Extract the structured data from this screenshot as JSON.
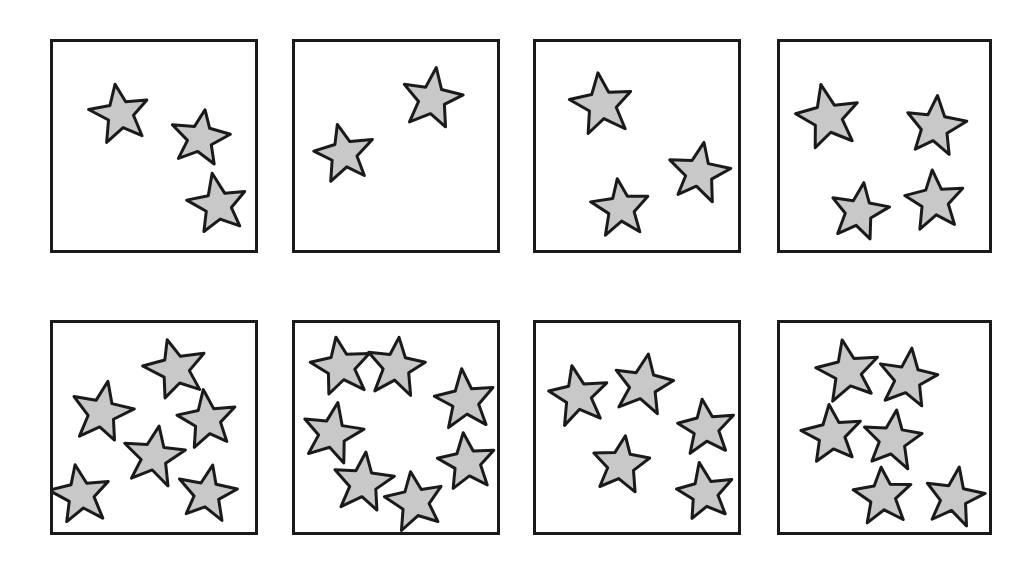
{
  "figure": {
    "background_color": "#ffffff",
    "panel_border_color": "#1a1a1a",
    "panel_border_width_px": 3,
    "star_fill_color": "#c8c8c8",
    "star_outline_color": "#1a1a1a",
    "star_outline_width_px": 3,
    "rows": 2,
    "columns": 4,
    "panel_count": 8,
    "total_star_count": 36
  },
  "panels": [
    {
      "id": "panel-1",
      "index": 1,
      "row": 1,
      "column": 1,
      "label": "Panel 1",
      "star_count": 3,
      "box": {
        "x": 50,
        "y": 39,
        "width": 208,
        "height": 214
      },
      "stars": [
        {
          "cx": 67,
          "cy": 72,
          "r": 31,
          "rotation": -12
        },
        {
          "cx": 147,
          "cy": 96,
          "r": 30,
          "rotation": 10
        },
        {
          "cx": 165,
          "cy": 163,
          "r": 31,
          "rotation": -8
        }
      ]
    },
    {
      "id": "panel-2",
      "index": 2,
      "row": 1,
      "column": 2,
      "label": "Panel 2",
      "star_count": 2,
      "box": {
        "x": 292,
        "y": 39,
        "width": 208,
        "height": 214
      },
      "stars": [
        {
          "cx": 137,
          "cy": 57,
          "r": 32,
          "rotation": 8
        },
        {
          "cx": 49,
          "cy": 112,
          "r": 31,
          "rotation": -10
        }
      ]
    },
    {
      "id": "panel-3",
      "index": 3,
      "row": 1,
      "column": 3,
      "label": "Panel 3",
      "star_count": 3,
      "box": {
        "x": 533,
        "y": 39,
        "width": 208,
        "height": 214
      },
      "stars": [
        {
          "cx": 66,
          "cy": 63,
          "r": 32,
          "rotation": -10
        },
        {
          "cx": 163,
          "cy": 131,
          "r": 31,
          "rotation": 9
        },
        {
          "cx": 85,
          "cy": 166,
          "r": 30,
          "rotation": -5
        }
      ]
    },
    {
      "id": "panel-4",
      "index": 4,
      "row": 1,
      "column": 4,
      "label": "Panel 4",
      "star_count": 4,
      "box": {
        "x": 777,
        "y": 39,
        "width": 215,
        "height": 214
      },
      "stars": [
        {
          "cx": 48,
          "cy": 76,
          "r": 33,
          "rotation": -12
        },
        {
          "cx": 155,
          "cy": 85,
          "r": 31,
          "rotation": 7
        },
        {
          "cx": 155,
          "cy": 159,
          "r": 31,
          "rotation": -6
        },
        {
          "cx": 79,
          "cy": 170,
          "r": 30,
          "rotation": 11
        }
      ]
    },
    {
      "id": "panel-5",
      "index": 5,
      "row": 2,
      "column": 1,
      "label": "Panel 5",
      "star_count": 6,
      "box": {
        "x": 50,
        "y": 320,
        "width": 208,
        "height": 215
      },
      "stars": [
        {
          "cx": 123,
          "cy": 46,
          "r": 32,
          "rotation": -14
        },
        {
          "cx": 49,
          "cy": 90,
          "r": 31,
          "rotation": 10
        },
        {
          "cx": 155,
          "cy": 97,
          "r": 30,
          "rotation": -7
        },
        {
          "cx": 101,
          "cy": 134,
          "r": 31,
          "rotation": 8
        },
        {
          "cx": 28,
          "cy": 172,
          "r": 31,
          "rotation": -10
        },
        {
          "cx": 154,
          "cy": 171,
          "r": 30,
          "rotation": 9
        }
      ]
    },
    {
      "id": "panel-6",
      "index": 6,
      "row": 2,
      "column": 2,
      "label": "Panel 6",
      "star_count": 7,
      "box": {
        "x": 292,
        "y": 320,
        "width": 208,
        "height": 215
      },
      "stars": [
        {
          "cx": 46,
          "cy": 44,
          "r": 31,
          "rotation": -10
        },
        {
          "cx": 101,
          "cy": 44,
          "r": 31,
          "rotation": 8
        },
        {
          "cx": 170,
          "cy": 78,
          "r": 31,
          "rotation": -7
        },
        {
          "cx": 37,
          "cy": 111,
          "r": 31,
          "rotation": 12
        },
        {
          "cx": 172,
          "cy": 140,
          "r": 30,
          "rotation": -9
        },
        {
          "cx": 68,
          "cy": 160,
          "r": 31,
          "rotation": 6
        },
        {
          "cx": 120,
          "cy": 179,
          "r": 31,
          "rotation": -11
        }
      ]
    },
    {
      "id": "panel-7",
      "index": 7,
      "row": 2,
      "column": 3,
      "label": "Panel 7",
      "star_count": 5,
      "box": {
        "x": 533,
        "y": 320,
        "width": 208,
        "height": 215
      },
      "stars": [
        {
          "cx": 42,
          "cy": 73,
          "r": 31,
          "rotation": -9
        },
        {
          "cx": 107,
          "cy": 62,
          "r": 32,
          "rotation": 9
        },
        {
          "cx": 170,
          "cy": 105,
          "r": 30,
          "rotation": -6
        },
        {
          "cx": 85,
          "cy": 142,
          "r": 31,
          "rotation": 7
        },
        {
          "cx": 169,
          "cy": 170,
          "r": 30,
          "rotation": -10
        }
      ]
    },
    {
      "id": "panel-8",
      "index": 8,
      "row": 2,
      "column": 4,
      "label": "Panel 8",
      "star_count": 6,
      "box": {
        "x": 777,
        "y": 320,
        "width": 215,
        "height": 215
      },
      "stars": [
        {
          "cx": 68,
          "cy": 49,
          "r": 32,
          "rotation": -11
        },
        {
          "cx": 128,
          "cy": 56,
          "r": 31,
          "rotation": 9
        },
        {
          "cx": 52,
          "cy": 112,
          "r": 31,
          "rotation": -7
        },
        {
          "cx": 113,
          "cy": 117,
          "r": 31,
          "rotation": 8
        },
        {
          "cx": 103,
          "cy": 173,
          "r": 30,
          "rotation": -6
        },
        {
          "cx": 174,
          "cy": 175,
          "r": 30,
          "rotation": 10
        }
      ]
    }
  ]
}
